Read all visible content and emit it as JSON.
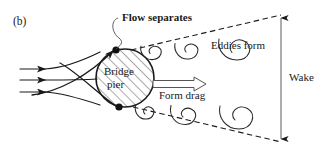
{
  "figure": {
    "panel_label": "(b)",
    "width": 327,
    "height": 165,
    "background": "#ffffff",
    "stroke_color": "#1a1a1a",
    "text_color": "#1a1a1a"
  },
  "labels": {
    "flow_separates": "Flow separates",
    "eddies_form": "Eddies form",
    "bridge_line1": "Bridge",
    "bridge_line2": "pier",
    "form_drag": "Form drag",
    "wake": "Wake"
  },
  "diagram": {
    "type": "fluid-flow-schematic",
    "pier": {
      "shape": "circle",
      "center_x": 125,
      "center_y": 78,
      "radius": 29,
      "fill": "diagonal-hatch"
    },
    "separation_points": [
      {
        "name": "upper-separation-point",
        "x": 115,
        "y": 50
      },
      {
        "name": "lower-separation-point",
        "x": 118,
        "y": 107
      }
    ],
    "inflow_streamlines": 3,
    "upper_eddies": 3,
    "lower_eddies": 3,
    "wake_boundary": "dashed",
    "wake_measure_arrow": "double-headed vertical"
  }
}
